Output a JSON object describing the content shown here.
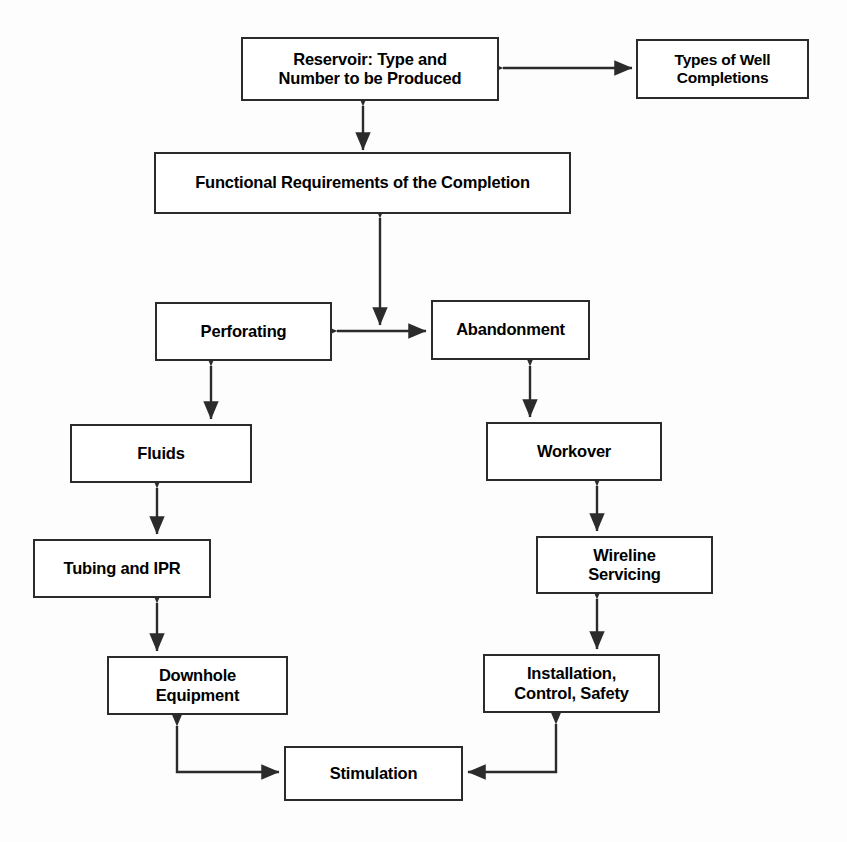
{
  "diagram": {
    "background_color": "#fdfdfd",
    "line_color": "#2b2b2b",
    "box_fill": "#ffffff",
    "nodes": [
      {
        "id": "reservoir",
        "label": "Reservoir:  Type and\nNumber to be Produced",
        "line1": "Reservoir:  Type and",
        "line2": "Number to be Produced"
      },
      {
        "id": "well_types",
        "label": "Types of Well\nCompletions",
        "line1": "Types of Well",
        "line2": "Completions"
      },
      {
        "id": "functional",
        "label": "Functional Requirements of the Completion",
        "line1": "Functional Requirements of the Completion",
        "line2": ""
      },
      {
        "id": "perforating",
        "label": "Perforating",
        "line1": "Perforating",
        "line2": ""
      },
      {
        "id": "abandonment",
        "label": "Abandonment",
        "line1": "Abandonment",
        "line2": ""
      },
      {
        "id": "fluids",
        "label": "Fluids",
        "line1": "Fluids",
        "line2": ""
      },
      {
        "id": "workover",
        "label": "Workover",
        "line1": "Workover",
        "line2": ""
      },
      {
        "id": "tubing_ipr",
        "label": "Tubing and IPR",
        "line1": "Tubing and IPR",
        "line2": ""
      },
      {
        "id": "wireline",
        "label": "Wireline\nServicing",
        "line1": "Wireline",
        "line2": "Servicing"
      },
      {
        "id": "downhole",
        "label": "Downhole\nEquipment",
        "line1": "Downhole",
        "line2": "Equipment"
      },
      {
        "id": "installation",
        "label": "Installation,\nControl, Safety",
        "line1": "Installation,",
        "line2": "Control, Safety"
      },
      {
        "id": "stimulation",
        "label": "Stimulation",
        "line1": "Stimulation",
        "line2": ""
      }
    ],
    "connections": [
      {
        "from": "reservoir",
        "to": "well_types",
        "style": "double-headed-horizontal"
      },
      {
        "from": "reservoir",
        "to": "functional",
        "style": "double-headed-vertical"
      },
      {
        "from": "functional",
        "to": "perforating",
        "style": "double-headed-vertical"
      },
      {
        "from": "perforating",
        "to": "abandonment",
        "style": "double-headed-horizontal"
      },
      {
        "from": "perforating",
        "to": "fluids",
        "style": "double-headed-vertical"
      },
      {
        "from": "abandonment",
        "to": "workover",
        "style": "double-headed-vertical"
      },
      {
        "from": "fluids",
        "to": "tubing_ipr",
        "style": "double-headed-vertical"
      },
      {
        "from": "workover",
        "to": "wireline",
        "style": "double-headed-vertical"
      },
      {
        "from": "tubing_ipr",
        "to": "downhole",
        "style": "double-headed-vertical"
      },
      {
        "from": "wireline",
        "to": "installation",
        "style": "double-headed-vertical"
      },
      {
        "from": "downhole",
        "to": "stimulation",
        "style": "double-headed-elbow"
      },
      {
        "from": "installation",
        "to": "stimulation",
        "style": "double-headed-elbow"
      }
    ]
  }
}
